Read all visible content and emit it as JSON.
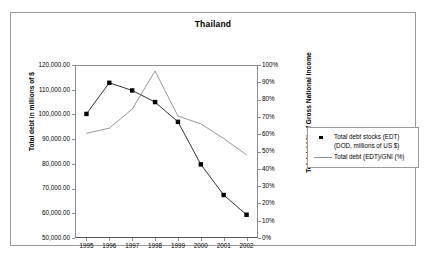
{
  "chart_data": {
    "type": "line",
    "title": "Thailand",
    "xlabel": "",
    "ylabel": "Total debt in millions of $",
    "y2label": "Total debt % of Gross National Income",
    "categories": [
      "1995",
      "1996",
      "1997",
      "1998",
      "1999",
      "2000",
      "2001",
      "2002"
    ],
    "ylim": [
      50000,
      120000
    ],
    "y2lim": [
      0,
      100
    ],
    "y_ticks": [
      "50,000.00",
      "60,000.00",
      "70,000.00",
      "80,000.00",
      "90,000.00",
      "100,000.00",
      "110,000.00",
      "120,000.00"
    ],
    "y_tick_values": [
      50000,
      60000,
      70000,
      80000,
      90000,
      100000,
      110000,
      120000
    ],
    "y2_ticks": [
      "0%",
      "10%",
      "20%",
      "30%",
      "40%",
      "50%",
      "60%",
      "70%",
      "80%",
      "90%",
      "100%"
    ],
    "y2_tick_values": [
      0,
      10,
      20,
      30,
      40,
      50,
      60,
      70,
      80,
      90,
      100
    ],
    "grid": false,
    "legend_position": "right",
    "series": [
      {
        "name": "Total debt stocks (EDT) (DOD, millions of US $)",
        "axis": "left",
        "style": "line-marker",
        "marker": "square",
        "color": "#000000",
        "values": [
          100200,
          112800,
          109700,
          105000,
          97000,
          79800,
          67400,
          59400
        ]
      },
      {
        "name": "Total debt (EDT)/GNI (%)",
        "axis": "right",
        "style": "line",
        "marker": "none",
        "color": "#8d8d8d",
        "values": [
          60.5,
          63.5,
          74.5,
          96.5,
          70.5,
          66.0,
          57.5,
          48.0
        ]
      }
    ]
  },
  "legend": {
    "items": [
      {
        "label": "Total debt stocks (EDT) (DOD, millions of US $)",
        "key": "square-marker-icon"
      },
      {
        "label": "Total debt (EDT)/GNI (%)",
        "key": "line-swatch-icon"
      }
    ]
  }
}
